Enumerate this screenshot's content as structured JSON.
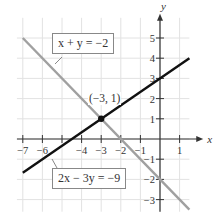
{
  "chart_data": {
    "type": "line",
    "title": "",
    "xlabel": "x",
    "ylabel": "y",
    "xlim": [
      -7.3,
      1.8
    ],
    "ylim": [
      -3.5,
      6
    ],
    "grid": true,
    "x_ticks": [
      -7,
      -6,
      -5,
      -4,
      -3,
      -2,
      -1,
      1
    ],
    "x_tick_labels": [
      "−7",
      "−6",
      "",
      "−4",
      "−3",
      "−2",
      "−1",
      "1"
    ],
    "y_ticks": [
      -3,
      -2,
      -1,
      1,
      2,
      3,
      4,
      5
    ],
    "y_tick_labels": [
      "−3",
      "−2",
      "−1",
      "1",
      "2",
      "3",
      "4",
      "5"
    ],
    "series": [
      {
        "name": "x + y = −2",
        "equation": "x + y = -2",
        "color": "#a0a0a0",
        "x": [
          -7,
          1.5
        ],
        "y": [
          5,
          -3.5
        ]
      },
      {
        "name": "2x − 3y = −9",
        "equation": "2x - 3y = -9",
        "color": "#111111",
        "x": [
          -7,
          1.5
        ],
        "y": [
          -1.667,
          4
        ]
      }
    ],
    "annotations": [
      {
        "type": "point",
        "x": -3,
        "y": 1,
        "label": "(−3, 1)"
      }
    ]
  },
  "labels": {
    "axis_x": "x",
    "axis_y": "y",
    "intersection": "(−3, 1)",
    "eq1": "x + y = −2",
    "eq2": "2x − 3y = −9"
  }
}
